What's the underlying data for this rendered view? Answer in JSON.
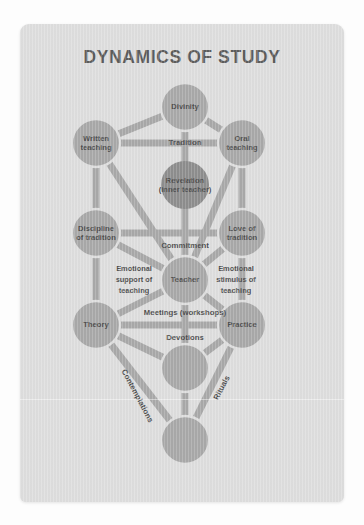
{
  "card": {
    "title": "DYNAMICS OF STUDY",
    "background_color": "#dedede",
    "node_color": "#a9a9a9",
    "node_dark_color": "#8e8e8e",
    "text_color": "#4f4f4f",
    "page_background": "#fdfdfd"
  },
  "diagram": {
    "type": "tree-of-life",
    "nodes": [
      {
        "id": "divinity",
        "label_lines": [
          "Divinity"
        ],
        "cx": 165,
        "cy": 83,
        "r": 24,
        "dark": false
      },
      {
        "id": "written",
        "label_lines": [
          "Written",
          "teaching"
        ],
        "cx": 76,
        "cy": 119,
        "r": 24,
        "dark": false
      },
      {
        "id": "oral",
        "label_lines": [
          "Oral",
          "teaching"
        ],
        "cx": 222,
        "cy": 119,
        "r": 24,
        "dark": false
      },
      {
        "id": "revelation",
        "label_lines": [
          "Revelation",
          "(inner teacher)"
        ],
        "cx": 165,
        "cy": 161,
        "r": 24,
        "dark": true
      },
      {
        "id": "discipline",
        "label_lines": [
          "Discipline",
          "of tradition"
        ],
        "cx": 76,
        "cy": 209,
        "r": 24,
        "dark": false
      },
      {
        "id": "love",
        "label_lines": [
          "Love of",
          "tradition"
        ],
        "cx": 222,
        "cy": 209,
        "r": 24,
        "dark": false
      },
      {
        "id": "teacher",
        "label_lines": [
          "Teacher"
        ],
        "cx": 165,
        "cy": 256,
        "r": 24,
        "dark": false
      },
      {
        "id": "theory",
        "label_lines": [
          "Theory"
        ],
        "cx": 76,
        "cy": 301,
        "r": 24,
        "dark": false
      },
      {
        "id": "practice",
        "label_lines": [
          "Practice"
        ],
        "cx": 222,
        "cy": 301,
        "r": 24,
        "dark": false
      },
      {
        "id": "foundation",
        "label_lines": [],
        "cx": 165,
        "cy": 344,
        "r": 24,
        "dark": false
      },
      {
        "id": "kingdom",
        "label_lines": [],
        "cx": 165,
        "cy": 416,
        "r": 24,
        "dark": false
      }
    ],
    "edges": [
      {
        "from": "divinity",
        "to": "written"
      },
      {
        "from": "divinity",
        "to": "oral"
      },
      {
        "from": "divinity",
        "to": "revelation"
      },
      {
        "from": "written",
        "to": "oral"
      },
      {
        "from": "written",
        "to": "discipline"
      },
      {
        "from": "written",
        "to": "teacher"
      },
      {
        "from": "oral",
        "to": "love"
      },
      {
        "from": "oral",
        "to": "teacher"
      },
      {
        "from": "revelation",
        "to": "teacher"
      },
      {
        "from": "discipline",
        "to": "love"
      },
      {
        "from": "discipline",
        "to": "teacher"
      },
      {
        "from": "discipline",
        "to": "theory"
      },
      {
        "from": "love",
        "to": "teacher"
      },
      {
        "from": "love",
        "to": "practice"
      },
      {
        "from": "teacher",
        "to": "theory"
      },
      {
        "from": "teacher",
        "to": "practice"
      },
      {
        "from": "teacher",
        "to": "foundation"
      },
      {
        "from": "theory",
        "to": "practice"
      },
      {
        "from": "theory",
        "to": "foundation"
      },
      {
        "from": "theory",
        "to": "kingdom"
      },
      {
        "from": "practice",
        "to": "foundation"
      },
      {
        "from": "practice",
        "to": "kingdom"
      },
      {
        "from": "foundation",
        "to": "kingdom"
      }
    ],
    "path_labels": [
      {
        "id": "tradition",
        "text": "Tradition",
        "x": 165,
        "y": 119,
        "rotate": 0,
        "size": "normal"
      },
      {
        "id": "commitment",
        "text": "Commitment",
        "x": 165,
        "y": 222,
        "rotate": 0,
        "size": "normal"
      },
      {
        "id": "meetings",
        "text": "Meetings (workshops)",
        "x": 165,
        "y": 289,
        "rotate": 0,
        "size": "normal"
      },
      {
        "id": "devotions",
        "text": "Devotions",
        "x": 165,
        "y": 314,
        "rotate": 0,
        "size": "normal"
      },
      {
        "id": "emotional-support",
        "text": "Emotional",
        "x": 114,
        "y": 245,
        "rotate": 0,
        "size": "small"
      },
      {
        "id": "emotional-support-2",
        "text": "support of",
        "x": 114,
        "y": 256,
        "rotate": 0,
        "size": "small"
      },
      {
        "id": "emotional-support-3",
        "text": "teaching",
        "x": 114,
        "y": 267,
        "rotate": 0,
        "size": "small"
      },
      {
        "id": "emotional-stimulus",
        "text": "Emotional",
        "x": 216,
        "y": 245,
        "rotate": 0,
        "size": "small"
      },
      {
        "id": "emotional-stimulus-2",
        "text": "stimulus of",
        "x": 216,
        "y": 256,
        "rotate": 0,
        "size": "small"
      },
      {
        "id": "emotional-stimulus-3",
        "text": "teaching",
        "x": 216,
        "y": 267,
        "rotate": 0,
        "size": "small"
      },
      {
        "id": "contemplations",
        "text": "Contemplations",
        "x": 117,
        "y": 372,
        "rotate": 62,
        "size": "normal"
      },
      {
        "id": "rituals",
        "text": "Rituals",
        "x": 202,
        "y": 364,
        "rotate": -62,
        "size": "normal"
      }
    ]
  }
}
